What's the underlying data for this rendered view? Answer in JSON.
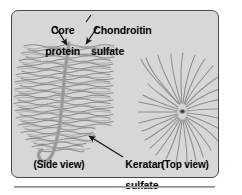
{
  "figure": {
    "name": "proteoglycan-aggregate-diagram",
    "panel": {
      "background_color": "#d7d7d7",
      "border_color": "#4a4a4a"
    },
    "labels": {
      "core_protein_line1": "Core",
      "core_protein_line2": "protein",
      "chondroitin_line1": "Chondroitin",
      "chondroitin_line2": "sulfate",
      "keratan_line1": "Keratan",
      "keratan_line2": "sulfate",
      "side_view": "(Side view)",
      "top_view": "(Top view)"
    },
    "strand_color": "#8d8d8d",
    "core_color": "#a0a0a0",
    "arrow_color": "#111111",
    "separator_color": "#8e8e8e"
  },
  "diagram_data": {
    "type": "diagram",
    "subject": "proteoglycan aggregate",
    "views": [
      {
        "name": "side-view",
        "caption": "(Side view)",
        "core_strand": "vertical wavy core protein ending in a J-hook",
        "side_chain_count": 46,
        "orientation": "horizontal wavy glycosaminoglycan chains"
      },
      {
        "name": "top-view",
        "caption": "(Top view)",
        "center": {
          "x": 177,
          "y": 102
        },
        "radial_strand_count": 28,
        "orientation": "wavy strands radiating from a central dark dot"
      }
    ],
    "callouts": [
      {
        "label": "Core protein",
        "target_view": "side-view",
        "arrow": "down-right"
      },
      {
        "label": "Chondroitin sulfate",
        "target_view": "side-view",
        "arrow": "down-left"
      },
      {
        "label": "Keratan sulfate",
        "target_view": "side-view",
        "arrow": "up-left"
      }
    ]
  }
}
